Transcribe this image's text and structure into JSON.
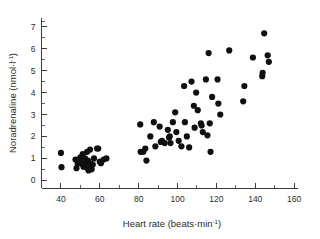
{
  "chart_data": {
    "type": "scatter",
    "title": "",
    "xlabel": "Heart rate (beats·min⁻¹)",
    "ylabel": "Noradrenaline (nmol·l⁻¹)",
    "xlabel_main": "Heart rate (beats·min",
    "xlabel_sup": "-1",
    "xlabel_tail": ")",
    "ylabel_main": "Noradrenaline (nmol·l",
    "ylabel_sup": "-1",
    "ylabel_tail": ")",
    "xlim": [
      30,
      162
    ],
    "ylim": [
      -0.35,
      7.4
    ],
    "xticks": [
      40,
      60,
      80,
      100,
      120,
      140,
      160
    ],
    "yticks": [
      0,
      1,
      2,
      3,
      4,
      5,
      6,
      7
    ],
    "xtick_labels": [
      "40",
      "60",
      "80",
      "100",
      "120",
      "140",
      "160"
    ],
    "ytick_labels": [
      "0",
      "1",
      "2",
      "3",
      "4",
      "5",
      "6",
      "7"
    ],
    "x_minor_ticks": true,
    "y_minor_ticks": true,
    "grid": false,
    "legend": false,
    "marker": "filled-circle",
    "marker_color": "#101010",
    "marker_size": 3.1,
    "axis_color": "#3b3b3b",
    "background_color": "#ffffff",
    "series": [
      {
        "name": "subjects",
        "points": [
          [
            40.0,
            1.25
          ],
          [
            40.3,
            0.6
          ],
          [
            47.5,
            0.95
          ],
          [
            48.0,
            0.55
          ],
          [
            48.6,
            0.75
          ],
          [
            49.0,
            0.85
          ],
          [
            49.4,
            0.8
          ],
          [
            50.0,
            1.05
          ],
          [
            50.3,
            0.8
          ],
          [
            50.8,
            0.75
          ],
          [
            51.2,
            1.2
          ],
          [
            51.6,
            0.62
          ],
          [
            52.0,
            0.85
          ],
          [
            52.4,
            1.0
          ],
          [
            52.8,
            0.72
          ],
          [
            53.1,
            0.58
          ],
          [
            53.5,
            1.3
          ],
          [
            53.9,
            0.9
          ],
          [
            54.2,
            0.45
          ],
          [
            54.6,
            0.7
          ],
          [
            55.0,
            1.4
          ],
          [
            55.4,
            0.75
          ],
          [
            55.8,
            0.5
          ],
          [
            56.4,
            0.72
          ],
          [
            57.0,
            1.0
          ],
          [
            58.6,
            1.45
          ],
          [
            59.2,
            1.45
          ],
          [
            60.0,
            0.85
          ],
          [
            60.6,
            0.78
          ],
          [
            62.0,
            0.95
          ],
          [
            63.4,
            1.0
          ],
          [
            80.8,
            2.55
          ],
          [
            81.0,
            1.3
          ],
          [
            82.4,
            1.3
          ],
          [
            83.4,
            1.45
          ],
          [
            84.0,
            0.9
          ],
          [
            86.0,
            2.0
          ],
          [
            87.8,
            2.65
          ],
          [
            88.6,
            1.55
          ],
          [
            90.8,
            2.45
          ],
          [
            91.4,
            1.75
          ],
          [
            92.0,
            1.8
          ],
          [
            93.4,
            1.7
          ],
          [
            95.0,
            2.3
          ],
          [
            95.6,
            1.95
          ],
          [
            96.0,
            2.0
          ],
          [
            96.4,
            1.7
          ],
          [
            97.6,
            2.65
          ],
          [
            98.8,
            3.1
          ],
          [
            99.4,
            2.2
          ],
          [
            100.6,
            1.8
          ],
          [
            102.0,
            1.55
          ],
          [
            103.4,
            4.3
          ],
          [
            103.8,
            2.65
          ],
          [
            104.8,
            2.0
          ],
          [
            106.0,
            1.5
          ],
          [
            107.2,
            4.5
          ],
          [
            108.4,
            3.4
          ],
          [
            108.8,
            2.4
          ],
          [
            109.6,
            4.0
          ],
          [
            110.4,
            3.2
          ],
          [
            112.0,
            2.6
          ],
          [
            112.4,
            2.5
          ],
          [
            113.0,
            2.2
          ],
          [
            114.6,
            4.6
          ],
          [
            115.4,
            2.05
          ],
          [
            116.0,
            5.8
          ],
          [
            116.6,
            2.6
          ],
          [
            117.0,
            1.3
          ],
          [
            117.8,
            3.8
          ],
          [
            120.6,
            4.6
          ],
          [
            121.0,
            3.5
          ],
          [
            122.0,
            3.0
          ],
          [
            126.6,
            5.92
          ],
          [
            133.8,
            3.6
          ],
          [
            134.4,
            4.3
          ],
          [
            138.8,
            5.6
          ],
          [
            143.6,
            4.75
          ],
          [
            143.8,
            4.9
          ],
          [
            144.6,
            6.7
          ],
          [
            146.4,
            5.7
          ],
          [
            147.0,
            5.4
          ]
        ]
      }
    ]
  }
}
